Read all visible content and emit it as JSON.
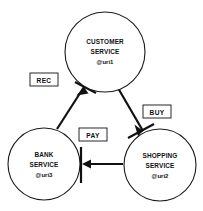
{
  "diagram": {
    "type": "service-interaction-cycle",
    "background_color": "#ffffff",
    "stroke_color": "#111111",
    "nodes": [
      {
        "id": "customer",
        "name": "customer-service-node",
        "line1": "CUSTOMER",
        "line2": "SERVICE",
        "uri": "@uri1",
        "cx": 105,
        "cy": 52,
        "r": 40
      },
      {
        "id": "bank",
        "name": "bank-service-node",
        "line1": "BANK",
        "line2": "SERVICE",
        "uri": "@uri3",
        "cx": 44,
        "cy": 164,
        "r": 36
      },
      {
        "id": "shopping",
        "name": "shopping-service-node",
        "line1": "SHOPPING",
        "line2": "SERVICE",
        "uri": "@uri2",
        "cx": 160,
        "cy": 165,
        "r": 36
      }
    ],
    "edges": [
      {
        "id": "buy",
        "name": "edge-buy",
        "label": "BUY",
        "from": "customer",
        "to": "shopping",
        "label_x": 157,
        "label_y": 113
      },
      {
        "id": "pay",
        "name": "edge-pay",
        "label": "PAY",
        "from": "shopping",
        "to": "bank",
        "label_x": 93,
        "label_y": 136
      },
      {
        "id": "rec",
        "name": "edge-rec",
        "label": "REC",
        "from": "bank",
        "to": "customer",
        "label_x": 44,
        "label_y": 81
      }
    ]
  }
}
